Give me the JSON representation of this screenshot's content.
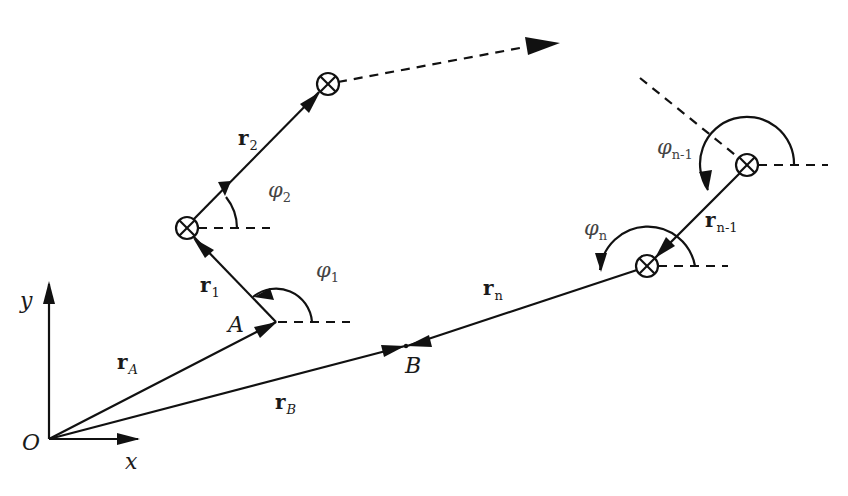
{
  "diagram": {
    "type": "kinematic chain vector diagram",
    "colors": {
      "stroke": "#111111",
      "background": "#ffffff",
      "angle_label": "#444444"
    },
    "axes": {
      "origin_label": "O",
      "x_label": "x",
      "y_label": "y"
    },
    "points": {
      "A": "A",
      "B": "B"
    },
    "vectors": {
      "rA": {
        "main": "r",
        "sub": "A"
      },
      "rB": {
        "main": "r",
        "sub": "B"
      },
      "r1": {
        "main": "r",
        "sub": "1"
      },
      "r2": {
        "main": "r",
        "sub": "2"
      },
      "rn1": {
        "main": "r",
        "sub": "n-1"
      },
      "rn": {
        "main": "r",
        "sub": "n"
      }
    },
    "angles": {
      "phi1": {
        "main": "φ",
        "sub": "1"
      },
      "phi2": {
        "main": "φ",
        "sub": "2"
      },
      "phin1": {
        "main": "φ",
        "sub": "n-1"
      },
      "phin": {
        "main": "φ",
        "sub": "n"
      }
    },
    "joint_symbol": "circled-cross",
    "joints": [
      "joint-1",
      "joint-2",
      "joint-n-1",
      "joint-n"
    ]
  }
}
